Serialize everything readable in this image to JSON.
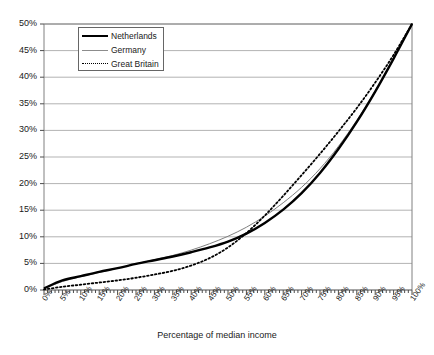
{
  "chart_data": {
    "type": "line",
    "title": "",
    "xlabel": "Percentage of median income",
    "ylabel": "",
    "xlim": [
      0,
      100
    ],
    "ylim": [
      0,
      50
    ],
    "grid": true,
    "legend_position": "top-left-inside",
    "x_tick_labels": [
      "0%",
      "5%",
      "10%",
      "15%",
      "20%",
      "25%",
      "30%",
      "35%",
      "40%",
      "45%",
      "50%",
      "55%",
      "60%",
      "65%",
      "70%",
      "75%",
      "80%",
      "85%",
      "90%",
      "95%",
      "100%"
    ],
    "y_tick_labels": [
      "0%",
      "5%",
      "10%",
      "15%",
      "20%",
      "25%",
      "30%",
      "35%",
      "40%",
      "45%",
      "50%"
    ],
    "x": [
      0,
      5,
      10,
      15,
      20,
      25,
      30,
      35,
      40,
      45,
      50,
      55,
      60,
      65,
      70,
      75,
      80,
      85,
      90,
      95,
      100
    ],
    "series": [
      {
        "name": "Netherlands",
        "style": "solid-thick",
        "color": "#000000",
        "values": [
          0.3,
          1.8,
          2.6,
          3.4,
          4.1,
          4.9,
          5.6,
          6.3,
          7.1,
          8.0,
          9.1,
          10.6,
          12.6,
          15.1,
          18.2,
          22.0,
          26.5,
          31.6,
          37.3,
          43.5,
          50.0
        ]
      },
      {
        "name": "Germany",
        "style": "solid-thin",
        "color": "#808080",
        "values": [
          0.2,
          1.6,
          2.5,
          3.3,
          4.1,
          4.9,
          5.7,
          6.5,
          7.5,
          8.7,
          10.1,
          11.8,
          13.9,
          16.4,
          19.3,
          22.8,
          27.0,
          31.9,
          37.4,
          43.5,
          50.0
        ]
      },
      {
        "name": "Great Britain",
        "style": "dotted",
        "color": "#000000",
        "values": [
          0.1,
          0.6,
          1.0,
          1.4,
          1.8,
          2.3,
          2.9,
          3.6,
          4.6,
          6.0,
          8.0,
          10.7,
          14.0,
          17.7,
          21.6,
          25.6,
          29.8,
          34.2,
          39.0,
          44.2,
          50.0
        ]
      }
    ]
  },
  "legend": {
    "items": [
      {
        "label": "Netherlands"
      },
      {
        "label": "Germany"
      },
      {
        "label": "Great Britain"
      }
    ]
  }
}
